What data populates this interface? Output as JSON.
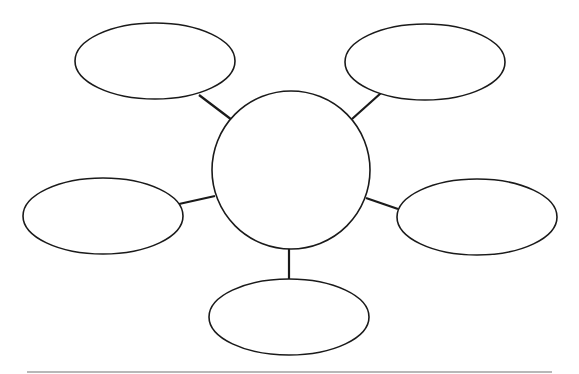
{
  "diagram": {
    "type": "bubble-map",
    "stroke_color": "#1a1a1a",
    "fill_color": "#ffffff",
    "center": {
      "label": "",
      "cx": 291,
      "cy": 170,
      "r": 79
    },
    "satellites": [
      {
        "id": "top-left",
        "label": "",
        "cx": 155,
        "cy": 61,
        "rx": 80,
        "ry": 38,
        "line": [
          232,
          120,
          199,
          95
        ]
      },
      {
        "id": "top-right",
        "label": "",
        "cx": 425,
        "cy": 62,
        "rx": 80,
        "ry": 38,
        "line": [
          352,
          119,
          381,
          93
        ]
      },
      {
        "id": "left",
        "label": "",
        "cx": 103,
        "cy": 216,
        "rx": 80,
        "ry": 38,
        "line": [
          215,
          196,
          179,
          204
        ]
      },
      {
        "id": "right",
        "label": "",
        "cx": 477,
        "cy": 217,
        "rx": 80,
        "ry": 38,
        "line": [
          366,
          198,
          398,
          209
        ]
      },
      {
        "id": "bottom",
        "label": "",
        "cx": 289,
        "cy": 317,
        "rx": 80,
        "ry": 38,
        "line": [
          289,
          249,
          289,
          279
        ]
      }
    ]
  },
  "footer_rule": {
    "x1": 27,
    "x2": 552,
    "y": 371,
    "color": "#b8b8b8"
  }
}
